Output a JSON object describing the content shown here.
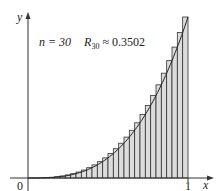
{
  "chart_data": {
    "type": "bar",
    "title": "",
    "annotation": {
      "n_label": "n = 30",
      "r_label": "R",
      "r_sub": "30",
      "r_value": "≈ 0.3502"
    },
    "function": "y = x^3",
    "n": 30,
    "estimate": 0.3502,
    "xlabel": "x",
    "ylabel": "y",
    "xlim": [
      0,
      1
    ],
    "ylim": [
      0,
      1
    ],
    "x_ticks": [
      "0",
      "1"
    ],
    "grid": false,
    "legend": "none",
    "bar_fill": "#dcdcdc",
    "bar_stroke": "#333333",
    "curve_color": "#222222"
  },
  "labels": {
    "origin": "0",
    "x_one": "1",
    "x_axis": "x",
    "y_axis": "y",
    "n_text": "n = 30",
    "r_main": "R",
    "r_sub": "30",
    "r_value": " ≈ 0.3502"
  }
}
